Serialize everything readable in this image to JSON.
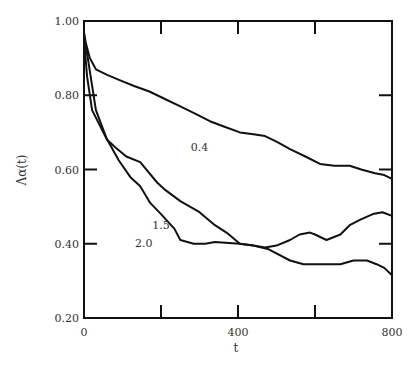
{
  "chart_data": {
    "type": "line",
    "title": "",
    "xlabel": "t",
    "ylabel": "Λα(t)",
    "xlim": [
      0,
      800
    ],
    "ylim": [
      0.2,
      1.0
    ],
    "grid": false,
    "legend": "inline labels",
    "x_ticks": [
      0,
      200,
      400,
      600,
      800
    ],
    "x_tick_labels": [
      "0",
      "",
      "400",
      "",
      "800"
    ],
    "y_ticks": [
      0.2,
      0.4,
      0.6,
      0.8,
      1.0
    ],
    "y_tick_labels": [
      "0.20",
      "0.40",
      "0.60",
      "0.80",
      "1.00"
    ],
    "series": [
      {
        "name": "0.4",
        "label_pos": {
          "x": 300,
          "y": 0.65
        },
        "x": [
          0,
          5,
          15,
          31,
          60,
          94,
          130,
          170,
          210,
          250,
          290,
          327,
          365,
          405,
          440,
          470,
          500,
          535,
          575,
          613,
          650,
          690,
          720,
          756,
          780,
          800
        ],
        "values": [
          0.97,
          0.94,
          0.9,
          0.87,
          0.855,
          0.84,
          0.825,
          0.81,
          0.79,
          0.77,
          0.75,
          0.73,
          0.715,
          0.7,
          0.695,
          0.69,
          0.675,
          0.655,
          0.635,
          0.615,
          0.61,
          0.61,
          0.6,
          0.59,
          0.585,
          0.575
        ]
      },
      {
        "name": "1.5",
        "label_pos": {
          "x": 200,
          "y": 0.44
        },
        "x": [
          0,
          10,
          31,
          60,
          81,
          110,
          146,
          190,
          211,
          250,
          275,
          300,
          340,
          370,
          405,
          440,
          470,
          500,
          535,
          560,
          587,
          600,
          630,
          666,
          690,
          718,
          750,
          775,
          800
        ],
        "values": [
          0.96,
          0.9,
          0.76,
          0.68,
          0.66,
          0.635,
          0.62,
          0.565,
          0.545,
          0.515,
          0.5,
          0.485,
          0.45,
          0.43,
          0.4,
          0.395,
          0.39,
          0.395,
          0.41,
          0.425,
          0.43,
          0.425,
          0.41,
          0.425,
          0.45,
          0.465,
          0.48,
          0.485,
          0.475
        ]
      },
      {
        "name": "2.0",
        "label_pos": {
          "x": 155,
          "y": 0.39
        },
        "x": [
          0,
          8,
          21,
          55,
          90,
          120,
          146,
          172,
          200,
          235,
          250,
          285,
          315,
          340,
          405,
          440,
          480,
          535,
          570,
          600,
          630,
          666,
          700,
          735,
          760,
          780,
          800
        ],
        "values": [
          0.95,
          0.85,
          0.76,
          0.69,
          0.625,
          0.58,
          0.555,
          0.51,
          0.48,
          0.44,
          0.41,
          0.4,
          0.4,
          0.405,
          0.4,
          0.395,
          0.385,
          0.355,
          0.345,
          0.345,
          0.345,
          0.345,
          0.355,
          0.355,
          0.345,
          0.335,
          0.315
        ]
      }
    ]
  }
}
